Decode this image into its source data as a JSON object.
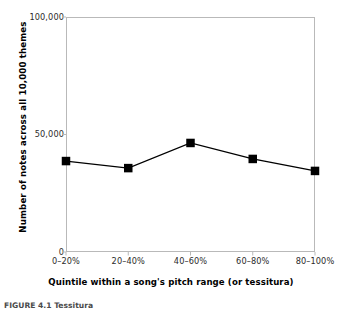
{
  "figure": {
    "caption": "FIGURE 4.1  Tessitura"
  },
  "chart_data": {
    "type": "line",
    "title": "",
    "xlabel": "Quintile within a song's pitch range (or tessitura)",
    "ylabel": "Number of notes across all 10,000 themes",
    "categories": [
      "0–20%",
      "20–40%",
      "40–60%",
      "60–80%",
      "80–100%"
    ],
    "values": [
      38700,
      35700,
      46400,
      39600,
      34500
    ],
    "ylim": [
      0,
      100000
    ],
    "yticks": [
      0,
      50000,
      100000
    ],
    "ytick_labels": [
      "0",
      "50,000",
      "100,000"
    ],
    "grid": false,
    "legend": "none",
    "marker": "square",
    "marker_color": "#000000",
    "line_color": "#000000",
    "frame_color": "#b9b9b9",
    "background": "#ffffff"
  }
}
